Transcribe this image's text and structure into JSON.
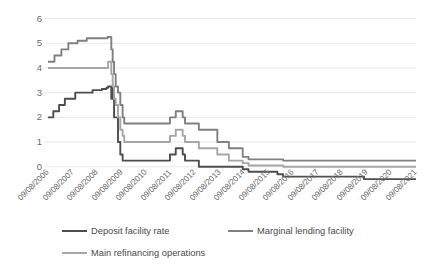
{
  "chart_data": {
    "type": "line",
    "title": "",
    "xlabel": "",
    "ylabel": "",
    "ylim": [
      -1,
      6
    ],
    "yticks": [
      0,
      1,
      2,
      3,
      4,
      5,
      6
    ],
    "ytick_labels": [
      "0",
      "1",
      "2",
      "3",
      "4",
      "5",
      "6"
    ],
    "grid": true,
    "legend_position": "bottom",
    "x": [
      "09/08/2006",
      "09/08/2007",
      "09/08/2008",
      "09/08/2009",
      "09/08/2010",
      "09/08/2011",
      "09/08/2012",
      "09/08/2013",
      "09/08/2014",
      "09/08/2015",
      "09/08/2016",
      "09/08/2017",
      "09/08/2018",
      "09/08/2019",
      "09/08/2020",
      "09/08/2021"
    ],
    "xtick_labels": [
      "09/08/2006",
      "09/08/2007",
      "09/08/2008",
      "09/08/2009",
      "09/08/2010",
      "09/08/2011",
      "09/08/2012",
      "09/08/2013",
      "09/08/2014",
      "09/08/2015",
      "09/08/2016",
      "09/08/2017",
      "09/08/2018",
      "09/08/2019",
      "09/08/2020",
      "09/08/2021"
    ],
    "xlim": [
      "09/08/2006",
      "09/08/2021"
    ],
    "series": [
      {
        "name": "Deposit facility rate",
        "color": "#4d4d4d",
        "interpolation": "step-after-with-early-ramp",
        "points": [
          [
            2006.02,
            2.0
          ],
          [
            2006.25,
            2.25
          ],
          [
            2006.5,
            2.5
          ],
          [
            2006.75,
            2.75
          ],
          [
            2007.0,
            2.75
          ],
          [
            2007.2,
            3.0
          ],
          [
            2007.5,
            3.0
          ],
          [
            2007.95,
            3.1
          ],
          [
            2008.35,
            3.15
          ],
          [
            2008.55,
            3.2
          ],
          [
            2008.62,
            3.25
          ],
          [
            2008.7,
            3.25
          ],
          [
            2008.76,
            2.75
          ],
          [
            2008.8,
            3.25
          ],
          [
            2008.84,
            2.75
          ],
          [
            2008.88,
            2.0
          ],
          [
            2008.95,
            2.0
          ],
          [
            2009.05,
            1.0
          ],
          [
            2009.15,
            0.5
          ],
          [
            2009.25,
            0.25
          ],
          [
            2009.4,
            0.25
          ],
          [
            2011.3,
            0.5
          ],
          [
            2011.45,
            0.5
          ],
          [
            2011.55,
            0.75
          ],
          [
            2011.85,
            0.5
          ],
          [
            2011.95,
            0.25
          ],
          [
            2012.55,
            0.0
          ],
          [
            2014.45,
            -0.1
          ],
          [
            2014.7,
            -0.2
          ],
          [
            2015.95,
            -0.3
          ],
          [
            2016.2,
            -0.4
          ],
          [
            2019.7,
            -0.5
          ],
          [
            2021.95,
            -0.5
          ]
        ]
      },
      {
        "name": "Marginal lending facility",
        "color": "#808080",
        "interpolation": "step-after-with-early-ramp",
        "points": [
          [
            2006.02,
            4.25
          ],
          [
            2006.3,
            4.5
          ],
          [
            2006.6,
            4.75
          ],
          [
            2006.9,
            5.0
          ],
          [
            2007.3,
            5.1
          ],
          [
            2007.7,
            5.2
          ],
          [
            2008.1,
            5.2
          ],
          [
            2008.45,
            5.2
          ],
          [
            2008.6,
            5.25
          ],
          [
            2008.7,
            5.25
          ],
          [
            2008.76,
            4.75
          ],
          [
            2008.82,
            4.25
          ],
          [
            2008.88,
            3.75
          ],
          [
            2008.95,
            3.25
          ],
          [
            2009.05,
            3.0
          ],
          [
            2009.15,
            2.5
          ],
          [
            2009.25,
            2.0
          ],
          [
            2009.32,
            1.75
          ],
          [
            2009.45,
            1.75
          ],
          [
            2011.3,
            2.0
          ],
          [
            2011.55,
            2.25
          ],
          [
            2011.85,
            2.0
          ],
          [
            2011.95,
            1.75
          ],
          [
            2012.55,
            1.5
          ],
          [
            2013.35,
            1.0
          ],
          [
            2013.85,
            0.75
          ],
          [
            2014.45,
            0.4
          ],
          [
            2014.7,
            0.3
          ],
          [
            2016.2,
            0.25
          ],
          [
            2021.95,
            0.25
          ]
        ]
      },
      {
        "name": "Main refinancing operations",
        "color": "#a6a6a6",
        "interpolation": "step-after-with-early-ramp",
        "points": [
          [
            2006.02,
            4.0
          ],
          [
            2006.5,
            4.0
          ],
          [
            2007.5,
            4.0
          ],
          [
            2008.2,
            4.0
          ],
          [
            2008.55,
            4.0
          ],
          [
            2008.62,
            4.25
          ],
          [
            2008.7,
            4.25
          ],
          [
            2008.76,
            3.75
          ],
          [
            2008.82,
            3.25
          ],
          [
            2008.88,
            2.75
          ],
          [
            2008.95,
            2.5
          ],
          [
            2009.05,
            2.0
          ],
          [
            2009.15,
            1.5
          ],
          [
            2009.25,
            1.25
          ],
          [
            2009.32,
            1.0
          ],
          [
            2009.45,
            1.0
          ],
          [
            2011.3,
            1.25
          ],
          [
            2011.55,
            1.5
          ],
          [
            2011.85,
            1.25
          ],
          [
            2011.95,
            1.0
          ],
          [
            2012.55,
            0.75
          ],
          [
            2013.35,
            0.5
          ],
          [
            2013.85,
            0.25
          ],
          [
            2014.45,
            0.15
          ],
          [
            2014.7,
            0.05
          ],
          [
            2016.2,
            0.0
          ],
          [
            2021.95,
            0.0
          ]
        ]
      }
    ]
  },
  "legend": {
    "items": [
      {
        "label": "Deposit facility rate",
        "color": "#4d4d4d"
      },
      {
        "label": "Marginal lending facility",
        "color": "#808080"
      },
      {
        "label": "Main refinancing operations",
        "color": "#a6a6a6"
      }
    ]
  },
  "colors": {
    "grid": "#e8e8e8",
    "axis_text": "#6b6b6b",
    "legend_text": "#4a4a4a",
    "background": "#ffffff"
  }
}
